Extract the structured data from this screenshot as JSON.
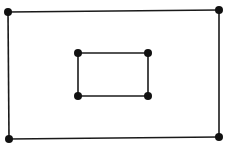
{
  "diagram": {
    "type": "graph",
    "colors": {
      "background": "#ffffff",
      "stroke": "#1a1a1a",
      "node": "#111111"
    },
    "outer": {
      "nodes": [
        {
          "id": "o1",
          "x": 8,
          "y": 12
        },
        {
          "id": "o2",
          "x": 219,
          "y": 10
        },
        {
          "id": "o3",
          "x": 219,
          "y": 137
        },
        {
          "id": "o4",
          "x": 9,
          "y": 139
        }
      ],
      "edges": [
        [
          "o1",
          "o2"
        ],
        [
          "o2",
          "o3"
        ],
        [
          "o3",
          "o4"
        ],
        [
          "o4",
          "o1"
        ]
      ]
    },
    "inner": {
      "nodes": [
        {
          "id": "i1",
          "x": 78,
          "y": 53
        },
        {
          "id": "i2",
          "x": 148,
          "y": 53
        },
        {
          "id": "i3",
          "x": 148,
          "y": 96
        },
        {
          "id": "i4",
          "x": 78,
          "y": 96
        }
      ],
      "edges": [
        [
          "i1",
          "i2"
        ],
        [
          "i2",
          "i3"
        ],
        [
          "i3",
          "i4"
        ],
        [
          "i4",
          "i1"
        ]
      ]
    }
  }
}
